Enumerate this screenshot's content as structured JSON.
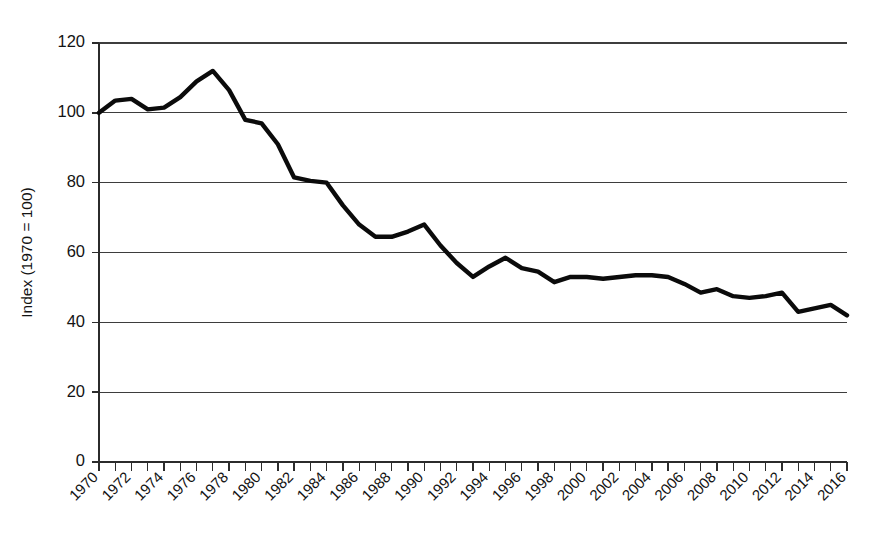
{
  "chart_data": {
    "type": "line",
    "title": "",
    "subtitle": "",
    "xlabel": "",
    "ylabel": "Index (1970 = 100)",
    "ylim": [
      0,
      120
    ],
    "xlim": [
      1970,
      2016
    ],
    "y_ticks": [
      0,
      20,
      40,
      60,
      80,
      100,
      120
    ],
    "y_tick_labels": [
      "0",
      "20",
      "40",
      "60",
      "80",
      "100",
      "120"
    ],
    "x_ticks": [
      1970,
      1971,
      1972,
      1973,
      1974,
      1975,
      1976,
      1977,
      1978,
      1979,
      1980,
      1981,
      1982,
      1983,
      1984,
      1985,
      1986,
      1987,
      1988,
      1989,
      1990,
      1991,
      1992,
      1993,
      1994,
      1995,
      1996,
      1997,
      1998,
      1999,
      2000,
      2001,
      2002,
      2003,
      2004,
      2005,
      2006,
      2007,
      2008,
      2009,
      2010,
      2011,
      2012,
      2013,
      2014,
      2015,
      2016
    ],
    "x_tick_labels": [
      "1970",
      "1972",
      "1974",
      "1976",
      "1978",
      "1980",
      "1982",
      "1984",
      "1986",
      "1988",
      "1990",
      "1992",
      "1994",
      "1996",
      "1998",
      "2000",
      "2002",
      "2004",
      "2006",
      "2008",
      "2010",
      "2012",
      "2014",
      "2016"
    ],
    "x_tick_label_step": 2,
    "grid": true,
    "grid_axis": "y",
    "legend": "none",
    "series": [
      {
        "name": "Index",
        "color": "#0b0b0b",
        "x": [
          1970,
          1971,
          1972,
          1973,
          1974,
          1975,
          1976,
          1977,
          1978,
          1979,
          1980,
          1981,
          1982,
          1983,
          1984,
          1985,
          1986,
          1987,
          1988,
          1989,
          1990,
          1991,
          1992,
          1993,
          1994,
          1995,
          1996,
          1997,
          1998,
          1999,
          2000,
          2001,
          2002,
          2003,
          2004,
          2005,
          2006,
          2007,
          2008,
          2009,
          2010,
          2011,
          2012,
          2013,
          2014,
          2015,
          2016
        ],
        "values": [
          100.0,
          103.5,
          104.0,
          101.0,
          101.5,
          104.5,
          109.0,
          112.0,
          106.5,
          98.0,
          97.0,
          91.0,
          81.5,
          80.5,
          80.0,
          73.5,
          68.0,
          64.5,
          64.5,
          66.0,
          68.0,
          62.0,
          57.0,
          53.0,
          56.0,
          58.5,
          55.5,
          54.5,
          51.5,
          53.0,
          53.0,
          52.5,
          53.0,
          53.5,
          53.5,
          53.0,
          51.0,
          48.5,
          49.5,
          47.5,
          47.0,
          47.5,
          48.5,
          43.0,
          44.0,
          45.0,
          42.0
        ]
      }
    ]
  },
  "axis": {
    "y_title": "Index (1970 = 100)"
  }
}
